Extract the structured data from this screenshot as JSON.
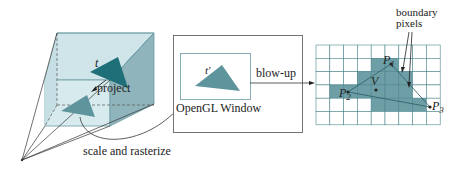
{
  "colors": {
    "frustum_fill": "#cfe5ea",
    "frustum_side": "#8fb4bb",
    "triangle_dark": "#1e6f77",
    "triangle_mid": "#5e959d",
    "pixel_fill": "#6e9ea6",
    "grid_line": "#4f8790",
    "line": "#333333"
  },
  "labels": {
    "t": "t",
    "project": "project",
    "scale_rasterize": "scale and rasterize",
    "t_prime": "t'",
    "blow_up": "blow-up",
    "opengl_window": "OpenGL Window",
    "boundary_line1": "boundary",
    "boundary_line2": "pixels",
    "p1": "P",
    "p1_sub": "1",
    "p2": "P",
    "p2_sub": "2",
    "p3": "P",
    "p3_sub": "3",
    "v": "V"
  },
  "grid": {
    "cols": 9,
    "rows": 6,
    "filled": [
      [
        1,
        4
      ],
      [
        1,
        5
      ],
      [
        2,
        3
      ],
      [
        2,
        4
      ],
      [
        2,
        5
      ],
      [
        2,
        6
      ],
      [
        3,
        1
      ],
      [
        3,
        2
      ],
      [
        3,
        3
      ],
      [
        3,
        4
      ],
      [
        3,
        5
      ],
      [
        3,
        6
      ],
      [
        4,
        4
      ],
      [
        4,
        5
      ],
      [
        4,
        6
      ],
      [
        4,
        7
      ]
    ]
  }
}
